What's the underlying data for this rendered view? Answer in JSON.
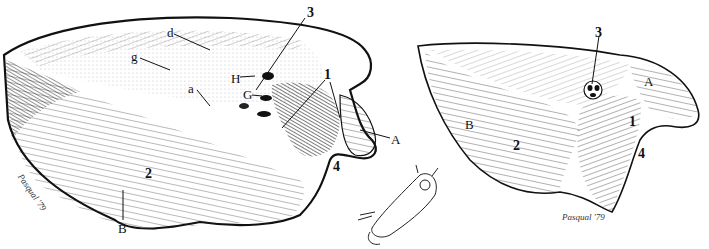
{
  "figure": {
    "type": "anatomical line drawing",
    "panels": [
      {
        "id": "left",
        "labels": [
          {
            "text": "3",
            "x": 307,
            "y": 6,
            "style": "bold"
          },
          {
            "text": "d",
            "x": 167,
            "y": 26,
            "style": "normal"
          },
          {
            "text": "g",
            "x": 131,
            "y": 50,
            "style": "normal"
          },
          {
            "text": "H",
            "x": 231,
            "y": 72,
            "style": "normal"
          },
          {
            "text": "1",
            "x": 324,
            "y": 68,
            "style": "bold"
          },
          {
            "text": "G",
            "x": 243,
            "y": 88,
            "style": "normal"
          },
          {
            "text": "a",
            "x": 188,
            "y": 82,
            "style": "normal"
          },
          {
            "text": "A",
            "x": 391,
            "y": 133,
            "style": "normal"
          },
          {
            "text": "4",
            "x": 333,
            "y": 160,
            "style": "bold"
          },
          {
            "text": "2",
            "x": 145,
            "y": 167,
            "style": "bold"
          },
          {
            "text": "B",
            "x": 118,
            "y": 222,
            "style": "normal"
          }
        ],
        "signature": "Pasqual '79"
      },
      {
        "id": "right",
        "labels": [
          {
            "text": "3",
            "x": 595,
            "y": 26,
            "style": "bold"
          },
          {
            "text": "A",
            "x": 644,
            "y": 75,
            "style": "normal"
          },
          {
            "text": "B",
            "x": 465,
            "y": 118,
            "style": "normal"
          },
          {
            "text": "1",
            "x": 629,
            "y": 115,
            "style": "bold"
          },
          {
            "text": "2",
            "x": 513,
            "y": 139,
            "style": "bold"
          },
          {
            "text": "4",
            "x": 638,
            "y": 147,
            "style": "bold"
          }
        ],
        "signature": "Pasqual '79"
      }
    ],
    "inset": {
      "description": "small sketch of whole animal with orientation marker"
    }
  }
}
